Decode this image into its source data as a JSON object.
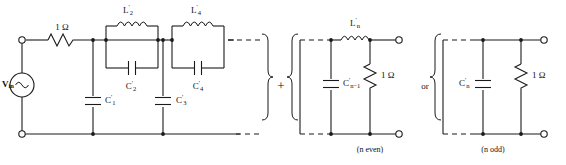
{
  "figure": {
    "type": "circuit-schematic",
    "colors": {
      "wire": "#1a1a1a",
      "background": "#ffffff",
      "text": "#111111"
    }
  },
  "source": {
    "label_main": "V",
    "label_sub": "in",
    "symbol": "ac-source-sine"
  },
  "series_resistor": {
    "value": "1 Ω"
  },
  "tanks": [
    {
      "inductor_main": "L",
      "inductor_sup": "'",
      "inductor_sub": "2",
      "capacitor_main": "C",
      "capacitor_sup": "'",
      "capacitor_sub": "2"
    },
    {
      "inductor_main": "L",
      "inductor_sup": "'",
      "inductor_sub": "4",
      "capacitor_main": "C",
      "capacitor_sup": "'",
      "capacitor_sub": "4"
    }
  ],
  "shunt_caps": [
    {
      "main": "C",
      "sup": "'",
      "sub": "1"
    },
    {
      "main": "C",
      "sup": "'",
      "sub": "3"
    }
  ],
  "connector": {
    "plus": "+",
    "or": "or"
  },
  "n_even_block": {
    "caption": "(n even)",
    "inductor_main": "L",
    "inductor_sup": "'",
    "inductor_sub": "n",
    "capacitor_main": "C",
    "capacitor_sup": "'",
    "capacitor_sub": "n−1",
    "load": "1 Ω"
  },
  "n_odd_block": {
    "caption": "(n odd)",
    "capacitor_main": "C",
    "capacitor_sup": "'",
    "capacitor_sub": "n",
    "load": "1 Ω"
  }
}
